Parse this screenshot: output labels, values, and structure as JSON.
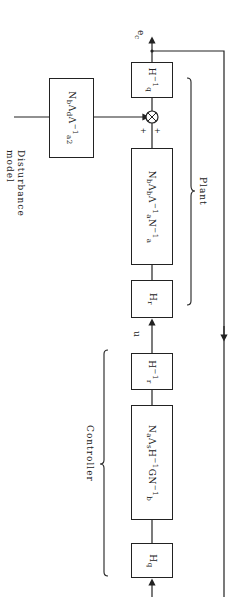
{
  "diagram": {
    "orientation": "rotated-90deg",
    "labels": {
      "disturbance_model": "Disturbance model",
      "plant": "Plant",
      "controller": "Controller",
      "output": "e",
      "output_sub": "c",
      "control_signal": "u",
      "plus_left": "+",
      "plus_right": "+"
    },
    "blocks": {
      "disturbance": {
        "main": "N",
        "sub1": "b",
        "mid": "Λ",
        "sub2": "d",
        "mid2": "Λ",
        "sup": "−1",
        "sub3": "a2"
      },
      "hq_inv": {
        "main": "H",
        "sup": "−1",
        "sub": "q"
      },
      "plant": {
        "t1": "N",
        "s1": "b",
        "t2": "Λ",
        "s2": "b",
        "t3": "Λ",
        "sup3": "−1",
        "s3": "a",
        "t4": "N",
        "sup4": "−1",
        "s4": "a"
      },
      "hr": {
        "main": "H",
        "sub": "r"
      },
      "hr_inv": {
        "main": "H",
        "sup": "−1",
        "sub": "r"
      },
      "controller": {
        "t1": "N",
        "s1": "a",
        "t2": "Λ",
        "s2": "s",
        "t3": "H",
        "sup3": "−1",
        "t4": "GN",
        "sup4": "−1",
        "s4": "b"
      },
      "hq": {
        "main": "H",
        "sub": "q"
      }
    },
    "colors": {
      "line": "#222222",
      "background": "#ffffff"
    }
  }
}
